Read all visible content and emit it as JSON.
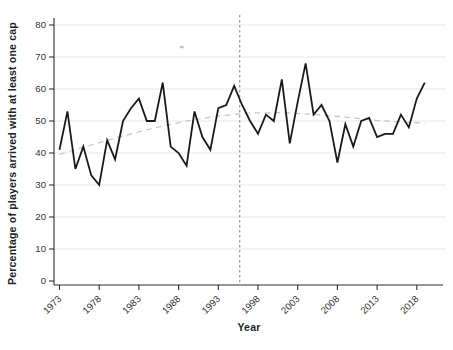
{
  "figure": {
    "background_color": "#ffffff",
    "plot_line_color": "#1a1a1a",
    "grid_color": "#e5e5e5",
    "axis_color": "#2e2e2e",
    "tick_label_color": "#333333"
  },
  "chart_data": {
    "type": "line",
    "title": "",
    "xlabel": "Year",
    "ylabel": "Percentage of players arrived with at least one cap",
    "xlim": [
      1972.3,
      2021.5
    ],
    "ylim": [
      0,
      80
    ],
    "grid": true,
    "legend": false,
    "x_ticks": [
      1973,
      1978,
      1983,
      1988,
      1993,
      1998,
      2003,
      2008,
      2013,
      2018
    ],
    "y_ticks": [
      0,
      10,
      20,
      30,
      40,
      50,
      60,
      70,
      80
    ],
    "x": [
      1973,
      1974,
      1975,
      1976,
      1977,
      1978,
      1979,
      1980,
      1981,
      1982,
      1983,
      1984,
      1985,
      1986,
      1987,
      1988,
      1989,
      1990,
      1991,
      1992,
      1993,
      1994,
      1995,
      1996,
      1997,
      1998,
      1999,
      2000,
      2001,
      2002,
      2003,
      2004,
      2005,
      2006,
      2007,
      2008,
      2009,
      2010,
      2011,
      2012,
      2013,
      2014,
      2015,
      2016,
      2017,
      2018,
      2019
    ],
    "series": [
      {
        "name": "percentage-of-players-with-at-least-one-cap",
        "style": "solid",
        "color": "#1a1a1a",
        "values": [
          41,
          53,
          35,
          42,
          33,
          30,
          44,
          38,
          50,
          54,
          57,
          50,
          50,
          62,
          42,
          40,
          36,
          53,
          45,
          41,
          54,
          55,
          61,
          55,
          50,
          46,
          52,
          50,
          63,
          43,
          56,
          68,
          52,
          55,
          50,
          37,
          49,
          42,
          50,
          51,
          45,
          46,
          46,
          52,
          48,
          57,
          62
        ]
      },
      {
        "name": "trend-line",
        "style": "dashed",
        "color": "#c5c5c5",
        "x": [
          1973,
          1977,
          1981,
          1985,
          1989,
          1993,
          1997,
          2001,
          2005,
          2009,
          2013,
          2016,
          2019
        ],
        "values": [
          39.6,
          42.5,
          45.3,
          47.9,
          50.0,
          51.6,
          52.5,
          52.6,
          52.1,
          51.2,
          50.2,
          49.7,
          49.3
        ]
      }
    ],
    "reference_line": {
      "orientation": "vertical",
      "x": 1995.7,
      "style": "dashed",
      "color": "#8c8c8c"
    },
    "stray_mark": {
      "x": 1988.4,
      "y": 73.1,
      "color": "#c2c2c2"
    }
  }
}
